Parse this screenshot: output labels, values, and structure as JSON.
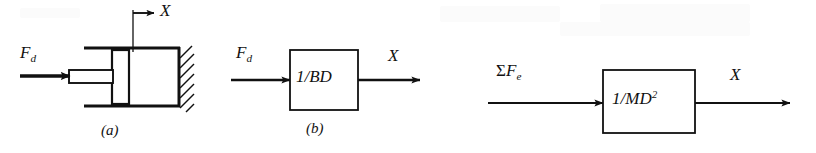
{
  "figure": {
    "background_color": "#ffffff",
    "ink_color": "#111111",
    "panels": [
      {
        "id": "a",
        "caption": "(a)",
        "kind": "dashpot-schematic",
        "description": "Damper (dashpot) attached to a fixed hatched wall, with piston rod driven by force F sub d and displacement X measured from a fixed datum line.",
        "input_label_base": "F",
        "input_label_sub": "d",
        "displacement_label": "X"
      },
      {
        "id": "b",
        "caption": "(b)",
        "kind": "block-diagram",
        "description": "Block diagram of the damper: input force F sub d through transfer function 1/BD gives output displacement X.",
        "input_label_base": "F",
        "input_label_sub": "d",
        "block_numerator": "1/",
        "block_transfer": "BD",
        "output_label": "X"
      },
      {
        "id": "c",
        "caption": "",
        "kind": "block-diagram",
        "description": "Block diagram of a mass: sum of external forces through transfer function 1/MD squared gives output displacement X.",
        "input_sigma": "Σ",
        "input_label_base": "F",
        "input_label_sub": "e",
        "block_numerator": "1/",
        "block_transfer": "MD",
        "block_exponent": "2",
        "output_label": "X"
      }
    ]
  }
}
